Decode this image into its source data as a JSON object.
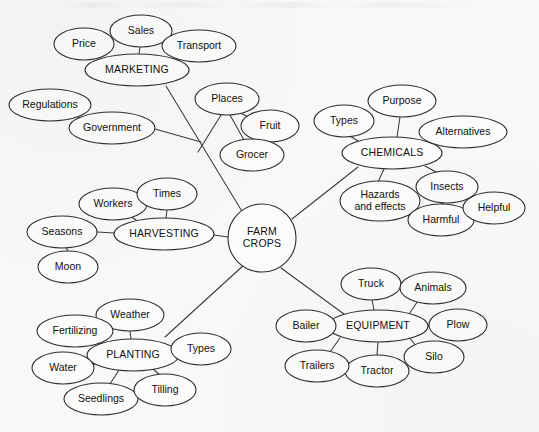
{
  "diagram": {
    "type": "mind-map",
    "background_color": "#f8f8f6",
    "stroke_color": "#2f2f2f",
    "node_fill_color": "#fbfbf9",
    "center": {
      "id": "farm-crops",
      "label_line1": "FARM",
      "label_line2": "CROPS",
      "shape": "circle",
      "cx": 262,
      "cy": 238,
      "r": 34
    },
    "nodes": [
      {
        "id": "marketing",
        "label": "MARKETING",
        "level": "branch",
        "cx": 137,
        "cy": 70,
        "rx": 52,
        "ry": 16
      },
      {
        "id": "sales",
        "label": "Sales",
        "level": "leaf",
        "cx": 141,
        "cy": 31,
        "rx": 31,
        "ry": 16
      },
      {
        "id": "price",
        "label": "Price",
        "level": "leaf",
        "cx": 84,
        "cy": 44,
        "rx": 30,
        "ry": 16
      },
      {
        "id": "transport",
        "label": "Transport",
        "level": "leaf",
        "cx": 199,
        "cy": 46,
        "rx": 37,
        "ry": 16
      },
      {
        "id": "regulations",
        "label": "Regulations",
        "level": "leaf",
        "cx": 50,
        "cy": 105,
        "rx": 41,
        "ry": 16
      },
      {
        "id": "government",
        "label": "Government",
        "level": "leaf",
        "cx": 112,
        "cy": 128,
        "rx": 43,
        "ry": 16
      },
      {
        "id": "places",
        "label": "Places",
        "level": "leaf",
        "cx": 227,
        "cy": 99,
        "rx": 32,
        "ry": 16
      },
      {
        "id": "fruit",
        "label": "Fruit",
        "level": "leaf",
        "cx": 270,
        "cy": 126,
        "rx": 29,
        "ry": 16
      },
      {
        "id": "grocer",
        "label": "Grocer",
        "level": "leaf",
        "cx": 252,
        "cy": 155,
        "rx": 32,
        "ry": 16
      },
      {
        "id": "chemicals",
        "label": "CHEMICALS",
        "level": "branch",
        "cx": 392,
        "cy": 153,
        "rx": 50,
        "ry": 16
      },
      {
        "id": "purpose",
        "label": "Purpose",
        "level": "leaf",
        "cx": 402,
        "cy": 101,
        "rx": 34,
        "ry": 16
      },
      {
        "id": "types-chem",
        "label": "Types",
        "level": "leaf",
        "cx": 344,
        "cy": 121,
        "rx": 30,
        "ry": 16
      },
      {
        "id": "alternatives",
        "label": "Alternatives",
        "level": "leaf",
        "cx": 463,
        "cy": 132,
        "rx": 44,
        "ry": 16
      },
      {
        "id": "hazards",
        "label": "Hazards and effects",
        "label_line1": "Hazards",
        "label_line2": "and effects",
        "level": "leaf",
        "cx": 380,
        "cy": 201,
        "rx": 40,
        "ry": 20
      },
      {
        "id": "insects",
        "label": "Insects",
        "level": "leaf",
        "cx": 447,
        "cy": 187,
        "rx": 31,
        "ry": 16
      },
      {
        "id": "harmful",
        "label": "Harmful",
        "level": "leaf",
        "cx": 441,
        "cy": 220,
        "rx": 33,
        "ry": 16
      },
      {
        "id": "helpful",
        "label": "Helpful",
        "level": "leaf",
        "cx": 494,
        "cy": 208,
        "rx": 31,
        "ry": 16
      },
      {
        "id": "harvesting",
        "label": "HARVESTING",
        "level": "branch",
        "cx": 164,
        "cy": 234,
        "rx": 50,
        "ry": 16
      },
      {
        "id": "workers",
        "label": "Workers",
        "level": "leaf",
        "cx": 113,
        "cy": 204,
        "rx": 34,
        "ry": 16
      },
      {
        "id": "times",
        "label": "Times",
        "level": "leaf",
        "cx": 167,
        "cy": 194,
        "rx": 30,
        "ry": 16
      },
      {
        "id": "seasons",
        "label": "Seasons",
        "level": "leaf",
        "cx": 62,
        "cy": 232,
        "rx": 35,
        "ry": 16
      },
      {
        "id": "moon",
        "label": "Moon",
        "level": "leaf",
        "cx": 68,
        "cy": 267,
        "rx": 30,
        "ry": 16
      },
      {
        "id": "planting",
        "label": "PLANTING",
        "level": "branch",
        "cx": 133,
        "cy": 355,
        "rx": 46,
        "ry": 16
      },
      {
        "id": "weather",
        "label": "Weather",
        "level": "leaf",
        "cx": 130,
        "cy": 315,
        "rx": 34,
        "ry": 16
      },
      {
        "id": "fertilizing",
        "label": "Fertilizing",
        "level": "leaf",
        "cx": 75,
        "cy": 331,
        "rx": 38,
        "ry": 16
      },
      {
        "id": "water",
        "label": "Water",
        "level": "leaf",
        "cx": 63,
        "cy": 368,
        "rx": 31,
        "ry": 16
      },
      {
        "id": "seedlings",
        "label": "Seedlings",
        "level": "leaf",
        "cx": 101,
        "cy": 399,
        "rx": 37,
        "ry": 16
      },
      {
        "id": "tilling",
        "label": "Tilling",
        "level": "leaf",
        "cx": 165,
        "cy": 390,
        "rx": 31,
        "ry": 16
      },
      {
        "id": "types-plant",
        "label": "Types",
        "level": "leaf",
        "cx": 201,
        "cy": 349,
        "rx": 30,
        "ry": 16
      },
      {
        "id": "equipment",
        "label": "EQUIPMENT",
        "level": "branch",
        "cx": 378,
        "cy": 326,
        "rx": 50,
        "ry": 16
      },
      {
        "id": "truck",
        "label": "Truck",
        "level": "leaf",
        "cx": 371,
        "cy": 284,
        "rx": 30,
        "ry": 16
      },
      {
        "id": "animals",
        "label": "Animals",
        "level": "leaf",
        "cx": 433,
        "cy": 288,
        "rx": 33,
        "ry": 16
      },
      {
        "id": "plow",
        "label": "Plow",
        "level": "leaf",
        "cx": 458,
        "cy": 325,
        "rx": 29,
        "ry": 16
      },
      {
        "id": "silo",
        "label": "Silo",
        "level": "leaf",
        "cx": 434,
        "cy": 357,
        "rx": 30,
        "ry": 16
      },
      {
        "id": "tractor",
        "label": "Tractor",
        "level": "leaf",
        "cx": 377,
        "cy": 371,
        "rx": 32,
        "ry": 16
      },
      {
        "id": "trailers",
        "label": "Trailers",
        "level": "leaf",
        "cx": 317,
        "cy": 366,
        "rx": 32,
        "ry": 16
      },
      {
        "id": "bailer",
        "label": "Bailer",
        "level": "leaf",
        "cx": 306,
        "cy": 326,
        "rx": 30,
        "ry": 16
      }
    ],
    "edges": [
      {
        "from": "farm-crops",
        "to": "marketing",
        "path": "M 243 213 L 166 86"
      },
      {
        "from": "marketing",
        "to": "sales",
        "path": "M 139 54 L 140 47"
      },
      {
        "from": "marketing",
        "to": "price",
        "path": "M 92 59 L 104 53"
      },
      {
        "from": "marketing",
        "to": "transport",
        "path": "M 186 60 L 171 54"
      },
      {
        "from": "government",
        "to": "regulations",
        "path": "M 83 119 L 73 115"
      },
      {
        "from": "government",
        "to": "marketing-line",
        "path": "M 155 129 L 201 142"
      },
      {
        "from": "places",
        "to": "fruit",
        "path": "M 240 113 L 249 117"
      },
      {
        "from": "places",
        "to": "grocer",
        "path": "M 230 115 L 244 140"
      },
      {
        "from": "places",
        "to": "center-line",
        "path": "M 221 115 L 198 152"
      },
      {
        "from": "farm-crops",
        "to": "chemicals",
        "path": "M 292 219 L 358 167"
      },
      {
        "from": "chemicals",
        "to": "purpose",
        "path": "M 397 137 L 400 117"
      },
      {
        "from": "chemicals",
        "to": "types-chem",
        "path": "M 358 141 L 350 136"
      },
      {
        "from": "chemicals",
        "to": "alternatives",
        "path": "M 437 145 L 429 138"
      },
      {
        "from": "chemicals",
        "to": "hazards",
        "path": "M 384 169 L 378 182"
      },
      {
        "from": "chemicals",
        "to": "insects",
        "path": "M 425 166 L 438 173"
      },
      {
        "from": "insects",
        "to": "harmful",
        "path": "M 443 203 L 440 205"
      },
      {
        "from": "insects",
        "to": "helpful",
        "path": "M 470 196 L 477 199"
      },
      {
        "from": "farm-crops",
        "to": "harvesting",
        "path": "M 228 237 L 214 235"
      },
      {
        "from": "harvesting",
        "to": "workers",
        "path": "M 139 222 L 130 216"
      },
      {
        "from": "harvesting",
        "to": "times",
        "path": "M 166 218 L 167 210"
      },
      {
        "from": "harvesting",
        "to": "seasons",
        "path": "M 114 233 L 97 232"
      },
      {
        "from": "seasons",
        "to": "moon",
        "path": "M 66 248 L 69 252"
      },
      {
        "from": "farm-crops",
        "to": "planting",
        "path": "M 245 264 L 165 337"
      },
      {
        "from": "planting",
        "to": "weather",
        "path": "M 131 339 L 130 331"
      },
      {
        "from": "planting",
        "to": "fertilizing",
        "path": "M 105 345 L 97 343"
      },
      {
        "from": "planting",
        "to": "water",
        "path": "M 96 364 L 90 365"
      },
      {
        "from": "planting",
        "to": "seedlings",
        "path": "M 119 370 L 110 384"
      },
      {
        "from": "planting",
        "to": "tilling",
        "path": "M 153 369 L 160 375"
      },
      {
        "from": "planting",
        "to": "types-plant",
        "path": "M 179 353 L 171 351"
      },
      {
        "from": "farm-crops",
        "to": "equipment",
        "path": "M 281 268 L 348 317"
      },
      {
        "from": "equipment",
        "to": "truck",
        "path": "M 374 310 L 372 300"
      },
      {
        "from": "equipment",
        "to": "animals",
        "path": "M 409 314 L 418 301"
      },
      {
        "from": "equipment",
        "to": "plow",
        "path": "M 428 326 L 429 325"
      },
      {
        "from": "equipment",
        "to": "silo",
        "path": "M 409 337 L 416 346"
      },
      {
        "from": "equipment",
        "to": "tractor",
        "path": "M 378 342 L 377 355"
      },
      {
        "from": "equipment",
        "to": "trailers",
        "path": "M 340 338 L 330 352"
      },
      {
        "from": "equipment",
        "to": "bailer",
        "path": "M 328 326 L 336 326"
      }
    ]
  }
}
